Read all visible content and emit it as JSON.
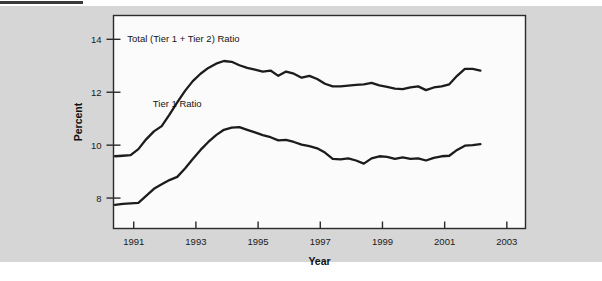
{
  "figure": {
    "background_color": "#d6d6d6",
    "plot_background_color": "#fbfbfb",
    "axis_color": "#2b2b2b",
    "line_color": "#1c1c1c"
  },
  "chart_data": {
    "type": "line",
    "title": "",
    "xlabel": "Year",
    "ylabel": "Percent",
    "xlim": [
      1990.35,
      2003.6
    ],
    "ylim": [
      6.85,
      14.9
    ],
    "xticks": [
      1991,
      1993,
      1995,
      1997,
      1999,
      2001,
      2003
    ],
    "xticklabels": [
      "1991",
      "1993",
      "1995",
      "1997",
      "1999",
      "2001",
      "2003"
    ],
    "yticks": [
      8,
      10,
      12,
      14
    ],
    "yticklabels": [
      "8",
      "10",
      "12",
      "14"
    ],
    "grid": false,
    "legend_position": "inline-annotation",
    "annotations": [
      {
        "text": "Total (Tier 1 + Tier 2) Ratio",
        "x": 1992.6,
        "y": 13.9
      },
      {
        "text": "Tier 1 Ratio",
        "x": 1992.4,
        "y": 11.45
      }
    ],
    "x": [
      1990.4,
      1990.65,
      1990.9,
      1991.15,
      1991.4,
      1991.65,
      1991.9,
      1992.15,
      1992.4,
      1992.65,
      1992.9,
      1993.15,
      1993.4,
      1993.65,
      1993.9,
      1994.15,
      1994.4,
      1994.65,
      1994.9,
      1995.15,
      1995.4,
      1995.65,
      1995.9,
      1996.15,
      1996.4,
      1996.65,
      1996.9,
      1997.15,
      1997.4,
      1997.65,
      1997.9,
      1998.15,
      1998.4,
      1998.65,
      1998.9,
      1999.15,
      1999.4,
      1999.65,
      1999.9,
      2000.15,
      2000.4,
      2000.65,
      2000.9,
      2001.15,
      2001.4,
      2001.65,
      2001.9,
      2002.15
    ],
    "series": [
      {
        "name": "Total (Tier 1 + Tier 2) Ratio",
        "values": [
          9.58,
          9.6,
          9.62,
          9.85,
          10.22,
          10.52,
          10.72,
          11.15,
          11.62,
          12.05,
          12.42,
          12.7,
          12.92,
          13.08,
          13.18,
          13.15,
          13.02,
          12.92,
          12.85,
          12.78,
          12.82,
          12.62,
          12.78,
          12.7,
          12.55,
          12.62,
          12.5,
          12.32,
          12.22,
          12.22,
          12.25,
          12.28,
          12.3,
          12.35,
          12.26,
          12.2,
          12.14,
          12.12,
          12.18,
          12.22,
          12.08,
          12.18,
          12.22,
          12.3,
          12.62,
          12.88,
          12.88,
          12.82
        ]
      },
      {
        "name": "Tier 1 Ratio",
        "values": [
          7.74,
          7.78,
          7.8,
          7.82,
          8.08,
          8.35,
          8.52,
          8.68,
          8.8,
          9.12,
          9.48,
          9.82,
          10.12,
          10.38,
          10.58,
          10.66,
          10.68,
          10.58,
          10.48,
          10.38,
          10.3,
          10.18,
          10.2,
          10.12,
          10.02,
          9.96,
          9.88,
          9.72,
          9.48,
          9.46,
          9.5,
          9.42,
          9.3,
          9.5,
          9.58,
          9.56,
          9.48,
          9.54,
          9.48,
          9.5,
          9.42,
          9.52,
          9.58,
          9.6,
          9.82,
          9.98,
          10.0,
          10.04
        ]
      }
    ]
  }
}
